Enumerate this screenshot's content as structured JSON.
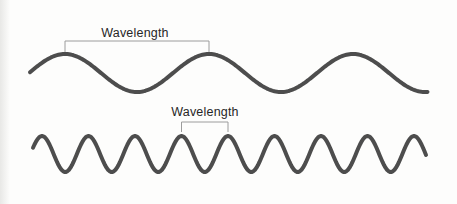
{
  "colors": {
    "background": "#fdfdfc",
    "wave_stroke": "#4d4d4d",
    "bracket_line": "#9c9c9c",
    "label_text": "#262626",
    "left_edge_shade": "#e8e8e6"
  },
  "waves": {
    "top": {
      "label": "Wavelength",
      "x_start": 30,
      "x_end": 428,
      "midline_y": 73,
      "amplitude": 19,
      "wavelength": 144,
      "first_crest_x": 65,
      "stroke_width": 4,
      "bracket": {
        "x1": 65,
        "x2": 209,
        "y": 41,
        "tick_bottom": 52,
        "label_x": 135,
        "label_y": 37
      }
    },
    "bottom": {
      "label": "Wavelength",
      "x_start": 33,
      "x_end": 427,
      "midline_y": 154,
      "amplitude": 18,
      "wavelength": 46.5,
      "first_crest_x": 42,
      "stroke_width": 4,
      "bracket": {
        "x1": 181.5,
        "x2": 228,
        "y": 122,
        "tick_bottom": 132,
        "label_x": 205,
        "label_y": 116
      }
    }
  }
}
